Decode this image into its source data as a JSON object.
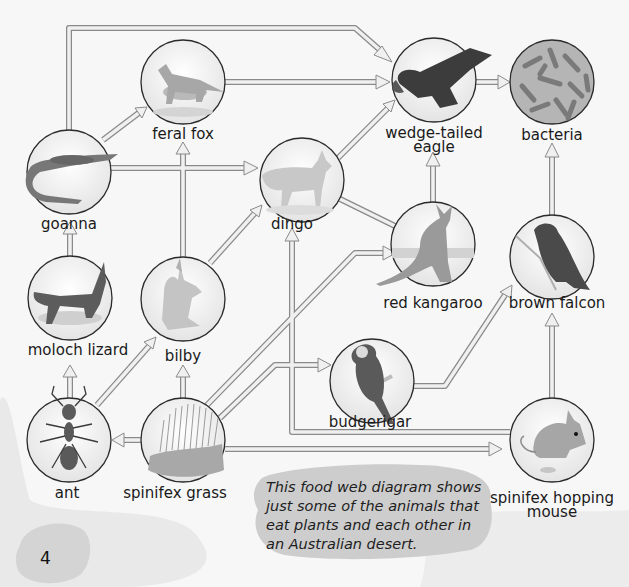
{
  "page_number": "4",
  "caption_lines": [
    "This food web diagram shows",
    "just some of the animals that",
    "eat plants and each other in",
    "an Australian desert."
  ],
  "colors": {
    "background": "#f7f7f7",
    "arrow_fill": "#efefef",
    "arrow_stroke": "#8a8a8a",
    "circle_stroke": "#2a2a2a",
    "caption_blob": "#cfcfcf",
    "page_blob": "#d6d6d6",
    "sand_blob": "#e6e6e6"
  },
  "nodes": {
    "feral_fox": {
      "label": "feral fox",
      "icon": "fox-icon"
    },
    "wedge_tailed_eagle": {
      "label_line1": "wedge-tailed",
      "label_line2": "eagle",
      "icon": "eagle-icon"
    },
    "bacteria": {
      "label": "bacteria",
      "icon": "bacteria-icon"
    },
    "goanna": {
      "label": "goanna",
      "icon": "goanna-icon"
    },
    "dingo": {
      "label": "dingo",
      "icon": "dingo-icon"
    },
    "red_kangaroo": {
      "label": "red kangaroo",
      "icon": "kangaroo-icon"
    },
    "brown_falcon": {
      "label": "brown falcon",
      "icon": "falcon-icon"
    },
    "moloch_lizard": {
      "label": "moloch lizard",
      "icon": "moloch-lizard-icon"
    },
    "bilby": {
      "label": "bilby",
      "icon": "bilby-icon"
    },
    "budgerigar": {
      "label": "budgerigar",
      "icon": "budgerigar-icon"
    },
    "ant": {
      "label": "ant",
      "icon": "ant-icon"
    },
    "spinifex_grass": {
      "label": "spinifex grass",
      "icon": "grass-icon"
    },
    "spinifex_hopping_mouse": {
      "label_line1": "spinifex hopping",
      "label_line2": "mouse",
      "icon": "mouse-icon"
    }
  },
  "edges": [
    {
      "from": "spinifex grass",
      "to": "ant"
    },
    {
      "from": "spinifex grass",
      "to": "bilby"
    },
    {
      "from": "spinifex grass",
      "to": "red kangaroo"
    },
    {
      "from": "spinifex grass",
      "to": "budgerigar"
    },
    {
      "from": "spinifex grass",
      "to": "spinifex hopping mouse"
    },
    {
      "from": "ant",
      "to": "moloch lizard"
    },
    {
      "from": "ant",
      "to": "bilby"
    },
    {
      "from": "moloch lizard",
      "to": "goanna"
    },
    {
      "from": "bilby",
      "to": "feral fox"
    },
    {
      "from": "bilby",
      "to": "dingo"
    },
    {
      "from": "goanna",
      "to": "feral fox"
    },
    {
      "from": "goanna",
      "to": "dingo"
    },
    {
      "from": "goanna",
      "to": "wedge-tailed eagle"
    },
    {
      "from": "feral fox",
      "to": "wedge-tailed eagle"
    },
    {
      "from": "dingo",
      "to": "wedge-tailed eagle"
    },
    {
      "from": "red kangaroo",
      "to": "dingo"
    },
    {
      "from": "red kangaroo",
      "to": "wedge-tailed eagle"
    },
    {
      "from": "spinifex hopping mouse",
      "to": "dingo"
    },
    {
      "from": "spinifex hopping mouse",
      "to": "brown falcon"
    },
    {
      "from": "budgerigar",
      "to": "brown falcon"
    },
    {
      "from": "wedge-tailed eagle",
      "to": "bacteria"
    },
    {
      "from": "brown falcon",
      "to": "bacteria"
    }
  ]
}
